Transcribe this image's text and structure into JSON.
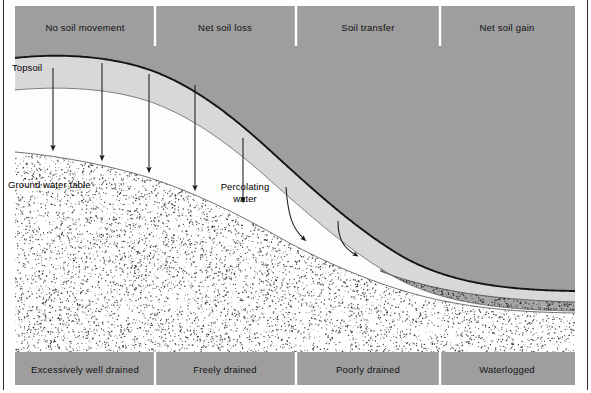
{
  "figure": {
    "width": 591,
    "height": 393,
    "background": "#ffffff",
    "frame_color": "#2a2a2a"
  },
  "colors": {
    "band_gray": "#9e9e9e",
    "band_divider": "#ffffff",
    "bedrock_gray": "#9e9e9e",
    "topsoil_light": "#d8d8d8",
    "subsoil_white": "#fdfdfd",
    "stipple_dot": "#2b2b2b",
    "outline_dark": "#1a1a1a",
    "outline_thin": "#555555",
    "arrow": "#1a1a1a",
    "text": "#000000"
  },
  "top_band": {
    "name": "soil-movement-band",
    "y": 6,
    "height": 40,
    "x_start": 15,
    "x_end": 575,
    "dividers": [
      155,
      296,
      440
    ],
    "segments": [
      {
        "label": "No soil movement",
        "center_x": 85
      },
      {
        "label": "Net soil loss",
        "center_x": 225
      },
      {
        "label": "Soil transfer",
        "center_x": 368
      },
      {
        "label": "Net soil gain",
        "center_x": 507
      }
    ]
  },
  "bottom_band": {
    "name": "drainage-band",
    "y": 352,
    "height": 33,
    "x_start": 15,
    "x_end": 575,
    "dividers": [
      155,
      296,
      440
    ],
    "segments": [
      {
        "label": "Excessively well drained",
        "center_x": 85
      },
      {
        "label": "Freely drained",
        "center_x": 225
      },
      {
        "label": "Poorly drained",
        "center_x": 368
      },
      {
        "label": "Waterlogged",
        "center_x": 507
      }
    ]
  },
  "inline_labels": [
    {
      "id": "topsoil",
      "text": "Topsoil",
      "x": 12,
      "y": 62,
      "align": "left"
    },
    {
      "id": "ground-water-table",
      "text": "Ground water table",
      "x": 8,
      "y": 179,
      "align": "left"
    },
    {
      "id": "percolating-water-line1",
      "text": "Percolating",
      "x": 245,
      "y": 181,
      "align": "center"
    },
    {
      "id": "percolating-water-line2",
      "text": "water",
      "x": 245,
      "y": 193,
      "align": "center"
    }
  ],
  "vertical_arrows": [
    {
      "id": "percolation-arrow-1",
      "x": 53,
      "y1": 68,
      "y2": 148
    },
    {
      "id": "percolation-arrow-2",
      "x": 102,
      "y1": 63,
      "y2": 158
    },
    {
      "id": "percolation-arrow-3",
      "x": 149,
      "y1": 74,
      "y2": 170
    },
    {
      "id": "percolation-arrow-4",
      "x": 195,
      "y1": 85,
      "y2": 188
    },
    {
      "id": "percolation-arrow-5",
      "x": 243,
      "y1": 138,
      "y2": 200
    }
  ],
  "curved_arrows": [
    {
      "id": "lateral-flow-arrow-1",
      "path": "M 286,187 C 288,215 292,228 304,239"
    },
    {
      "id": "lateral-flow-arrow-2",
      "path": "M 338,221 C 338,240 344,248 356,255"
    }
  ],
  "profile": {
    "surface": "M 15,58 C 60,53 110,56 150,70 C 195,86 235,118 275,155 C 320,196 360,232 405,258 C 450,282 500,290 575,291",
    "topsoil_base": "M 15,90 C 60,86 108,88 148,101 C 192,116 232,146 272,182 C 316,221 356,256 400,280 C 448,304 505,310 575,311",
    "watertable": "M 15,152 C 60,156 108,165 150,178 C 196,193 240,215 284,240 C 330,265 380,286 430,298 C 478,309 520,312 575,313",
    "subsoil_right_base": "M 380,271 C 430,290 490,300 575,302"
  },
  "stipple": {
    "water_density": 0.55,
    "dark_density": 0.9,
    "seed": 20240617
  }
}
